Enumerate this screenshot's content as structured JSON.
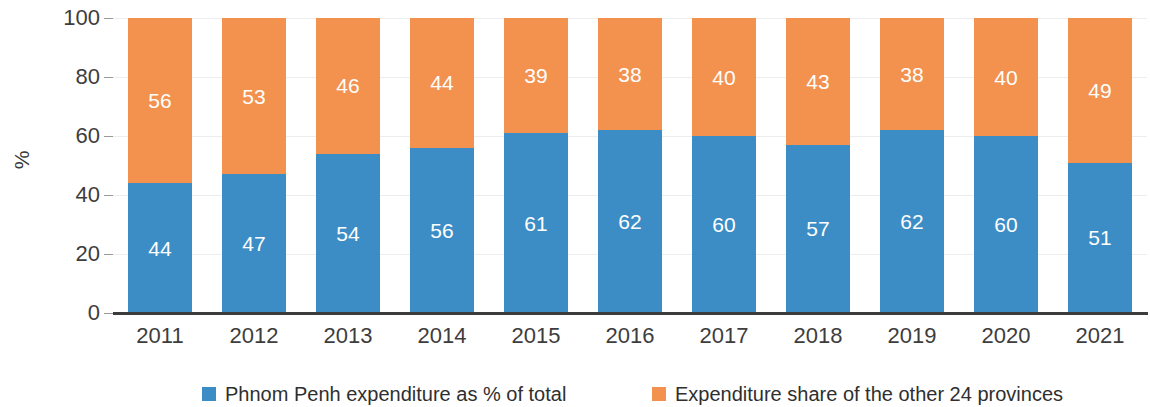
{
  "chart_data": {
    "type": "bar",
    "subtype": "100% stacked bar",
    "title": "",
    "xlabel": "",
    "ylabel": "%",
    "ylim": [
      0,
      100
    ],
    "yticks": [
      0,
      20,
      40,
      60,
      80,
      100
    ],
    "grid": true,
    "legend_position": "bottom",
    "categories": [
      "2011",
      "2012",
      "2013",
      "2014",
      "2015",
      "2016",
      "2017",
      "2018",
      "2019",
      "2020",
      "2021"
    ],
    "series": [
      {
        "name": "Phnom Penh expenditure as % of total",
        "color": "#3c8dc5",
        "values": [
          44,
          47,
          54,
          56,
          61,
          62,
          60,
          57,
          62,
          60,
          51
        ]
      },
      {
        "name": "Expenditure share of the other 24 provinces",
        "color": "#f2924e",
        "values": [
          56,
          53,
          46,
          44,
          39,
          38,
          40,
          43,
          38,
          40,
          49
        ]
      }
    ]
  },
  "axis": {
    "y_title": "%",
    "y_tick_labels": [
      "100",
      "80",
      "60",
      "40",
      "20",
      "0"
    ],
    "x_tick_labels": [
      "2011",
      "2012",
      "2013",
      "2014",
      "2015",
      "2016",
      "2017",
      "2018",
      "2019",
      "2020",
      "2021"
    ]
  },
  "legend": {
    "items": [
      {
        "label": "Phnom Penh expenditure as % of total",
        "color": "#3c8dc5"
      },
      {
        "label": "Expenditure share of the other 24 provinces",
        "color": "#f2924e"
      }
    ]
  },
  "colors": {
    "series_blue": "#3c8dc5",
    "series_orange": "#f2924e",
    "axis_line": "#3c3c3c",
    "gridline": "#ededed",
    "text": "#3d3d3d",
    "label_text": "#ffffff"
  }
}
